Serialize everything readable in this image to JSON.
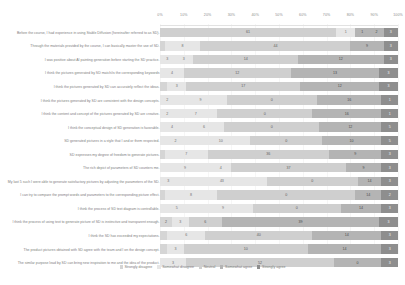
{
  "chart_data": {
    "type": "bar",
    "title": "",
    "subtitle": "",
    "xlabel": "",
    "ylabel": "",
    "orientation": "horizontal",
    "stacked": true,
    "normalized_percent": true,
    "grid": true,
    "legend_position": "bottom",
    "xlim": [
      0,
      100
    ],
    "xticks": [
      "0%",
      "10%",
      "20%",
      "30%",
      "40%",
      "50%",
      "60%",
      "70%",
      "80%",
      "90%",
      "100%"
    ],
    "legend": [
      "Strongly disagree",
      "Somewhat disagree",
      "Neutral",
      "Somewhat agree",
      "Strongly agree"
    ],
    "series": [
      {
        "name": "Strongly disagree",
        "color": "#d5d5d5"
      },
      {
        "name": "Somewhat disagree",
        "color": "#e6e6e6"
      },
      {
        "name": "Neutral",
        "color": "#cfcfcf"
      },
      {
        "name": "Somewhat agree",
        "color": "#b4b4b4"
      },
      {
        "name": "Strongly agree",
        "color": "#8e8e8e"
      }
    ],
    "categories": [
      "Before the course, I had experience in using Stable Diffusion (hereinafter referred to as SD).",
      "Through the materials provided by the course, I can basically master the use of SD.",
      "I was positive about AI painting generation before starting the SD practice.",
      "I think the pictures generated by SD match/is the corresponding keywords",
      "I think the pictures generated by SD can accurately reflect the ideas.",
      "I think the pictures generated by SD are consistent with the design concepts.",
      "I think the content and concept of the pictures generated by SD are creative.",
      "I think the conceptual design of SD generation is favorable.",
      "SD generated pictures in a style that I and or them respected.",
      "SD expresses my degree of freedom to generate pictures.",
      "The rich depict of parameters of SD counters me.",
      "My last 5 such I were able to generate satisfactory pictures by adjusting the parameters of the SD.",
      "I can try to compare the prompt words and parameters to the corresponding picture effect.",
      "I think the process of SD text diagram is controllable.",
      "I think the process of using text to generate picture of SD is instinctive and transparent enough.",
      "I think the SD has exceeded my expectations.",
      "The product pictures obtained with SD agree with the team and I on the design concept.",
      "The similar purpose lead by SD can bring new inspiration to me and the idea of the product."
    ],
    "rows": [
      {
        "label": "Before the course, I had experience in using Stable Diffusion (hereinafter referred to as SD).",
        "values": [
          0,
          0,
          61,
          1,
          1,
          2,
          3
        ],
        "segments": [
          {
            "series": 2,
            "value": 61,
            "pct": 74.0
          },
          {
            "series": 1,
            "value": 1,
            "pct": 8.0
          },
          {
            "series": 3,
            "value": 1,
            "pct": 6.0
          },
          {
            "series": 3,
            "value": 2,
            "pct": 6.0
          },
          {
            "series": 4,
            "value": 3,
            "pct": 6.0
          }
        ]
      },
      {
        "label": "Through the materials provided by the course, I can basically master the use of SD.",
        "segments": [
          {
            "series": 0,
            "value": 1,
            "pct": 2.0
          },
          {
            "series": 1,
            "value": 8,
            "pct": 15.0
          },
          {
            "series": 2,
            "value": 44,
            "pct": 63.0
          },
          {
            "series": 3,
            "value": 9,
            "pct": 14.0
          },
          {
            "series": 4,
            "value": 3,
            "pct": 6.0
          }
        ]
      },
      {
        "label": "I was positive about AI painting generation before starting the SD practice.",
        "segments": [
          {
            "series": 1,
            "value": 3,
            "pct": 6.0
          },
          {
            "series": 1,
            "value": 3,
            "pct": 8.0
          },
          {
            "series": 2,
            "value": 14,
            "pct": 44.0
          },
          {
            "series": 3,
            "value": 12,
            "pct": 36.0
          },
          {
            "series": 4,
            "value": 3,
            "pct": 6.0
          }
        ]
      },
      {
        "label": "I think the pictures generated by SD match/is the corresponding keywords",
        "segments": [
          {
            "series": 1,
            "value": 4,
            "pct": 10.0
          },
          {
            "series": 2,
            "value": 12,
            "pct": 45.0
          },
          {
            "series": 3,
            "value": 13,
            "pct": 37.0
          },
          {
            "series": 4,
            "value": 3,
            "pct": 8.0
          }
        ]
      },
      {
        "label": "I think the pictures generated by SD can accurately reflect the ideas.",
        "segments": [
          {
            "series": 0,
            "value": 1,
            "pct": 3.0
          },
          {
            "series": 1,
            "value": 3,
            "pct": 8.0
          },
          {
            "series": 2,
            "value": 17,
            "pct": 48.0
          },
          {
            "series": 3,
            "value": 12,
            "pct": 33.0
          },
          {
            "series": 4,
            "value": 3,
            "pct": 8.0
          }
        ]
      },
      {
        "label": "I think the pictures generated by SD are consistent with the design concepts.",
        "segments": [
          {
            "series": 1,
            "value": 2,
            "pct": 6.0
          },
          {
            "series": 1,
            "value": 9,
            "pct": 22.0
          },
          {
            "series": 2,
            "value": 0,
            "pct": 38.0
          },
          {
            "series": 3,
            "value": 16,
            "pct": 27.0
          },
          {
            "series": 4,
            "value": 1,
            "pct": 7.0
          }
        ]
      },
      {
        "label": "I think the content and concept of the pictures generated by SD are creative.",
        "segments": [
          {
            "series": 1,
            "value": 2,
            "pct": 6.0
          },
          {
            "series": 1,
            "value": 7,
            "pct": 18.0
          },
          {
            "series": 2,
            "value": 0,
            "pct": 40.0
          },
          {
            "series": 3,
            "value": 16,
            "pct": 29.0
          },
          {
            "series": 4,
            "value": 1,
            "pct": 7.0
          }
        ]
      },
      {
        "label": "I think the conceptual design of SD generation is favorable.",
        "segments": [
          {
            "series": 1,
            "value": 4,
            "pct": 10.0
          },
          {
            "series": 1,
            "value": 6,
            "pct": 17.0
          },
          {
            "series": 2,
            "value": 0,
            "pct": 40.0
          },
          {
            "series": 3,
            "value": 12,
            "pct": 26.0
          },
          {
            "series": 4,
            "value": 5,
            "pct": 7.0
          }
        ]
      },
      {
        "label": "SD generated pictures in a style that I and or them respected.",
        "segments": [
          {
            "series": 1,
            "value": 2,
            "pct": 13.0
          },
          {
            "series": 1,
            "value": 10,
            "pct": 25.0
          },
          {
            "series": 2,
            "value": 0,
            "pct": 30.0
          },
          {
            "series": 3,
            "value": 10,
            "pct": 25.0
          },
          {
            "series": 4,
            "value": 5,
            "pct": 7.0
          }
        ]
      },
      {
        "label": "SD expresses my degree of freedom to generate pictures.",
        "segments": [
          {
            "series": 0,
            "value": 1,
            "pct": 2.0
          },
          {
            "series": 1,
            "value": 7,
            "pct": 18.0
          },
          {
            "series": 2,
            "value": 36,
            "pct": 51.0
          },
          {
            "series": 3,
            "value": 9,
            "pct": 22.0
          },
          {
            "series": 4,
            "value": 3,
            "pct": 7.0
          }
        ]
      },
      {
        "label": "The rich depict of parameters of SD counters me.",
        "segments": [
          {
            "series": 1,
            "value": 9,
            "pct": 21.0
          },
          {
            "series": 1,
            "value": 4,
            "pct": 9.0
          },
          {
            "series": 2,
            "value": 37,
            "pct": 48.0
          },
          {
            "series": 3,
            "value": 9,
            "pct": 15.0
          },
          {
            "series": 4,
            "value": 3,
            "pct": 7.0
          }
        ]
      },
      {
        "label": "My last 5 such I were able to generate satisfactory pictures by adjusting the parameters of the SD.",
        "segments": [
          {
            "series": 1,
            "value": 3,
            "pct": 7.0
          },
          {
            "series": 1,
            "value": 43,
            "pct": 38.0
          },
          {
            "series": 2,
            "value": 0,
            "pct": 38.0
          },
          {
            "series": 3,
            "value": 14,
            "pct": 10.0
          },
          {
            "series": 4,
            "value": 3,
            "pct": 7.0
          }
        ]
      },
      {
        "label": "I can try to compare the prompt words and parameters to the corresponding picture effect.",
        "segments": [
          {
            "series": 0,
            "value": 1,
            "pct": 2.0
          },
          {
            "series": 1,
            "value": 8,
            "pct": 22.0
          },
          {
            "series": 2,
            "value": 0,
            "pct": 58.0
          },
          {
            "series": 3,
            "value": 14,
            "pct": 11.0
          },
          {
            "series": 4,
            "value": 2,
            "pct": 7.0
          }
        ]
      },
      {
        "label": "I think the process of SD text diagram is controllable.",
        "segments": [
          {
            "series": 1,
            "value": 5,
            "pct": 14.0
          },
          {
            "series": 1,
            "value": 9,
            "pct": 25.0
          },
          {
            "series": 2,
            "value": 0,
            "pct": 37.0
          },
          {
            "series": 3,
            "value": 14,
            "pct": 17.0
          },
          {
            "series": 4,
            "value": 3,
            "pct": 7.0
          }
        ]
      },
      {
        "label": "I think the process of using text to generate picture of SD is instinctive and transparent enough.",
        "segments": [
          {
            "series": 0,
            "value": 2,
            "pct": 5.0
          },
          {
            "series": 1,
            "value": 3,
            "pct": 7.0
          },
          {
            "series": 2,
            "value": 6,
            "pct": 14.0
          },
          {
            "series": 3,
            "value": 39,
            "pct": 66.0
          },
          {
            "series": 4,
            "value": 3,
            "pct": 8.0
          }
        ]
      },
      {
        "label": "I think the SD has exceeded my expectations.",
        "segments": [
          {
            "series": 0,
            "value": 1,
            "pct": 3.0
          },
          {
            "series": 1,
            "value": 6,
            "pct": 16.0
          },
          {
            "series": 2,
            "value": 40,
            "pct": 45.0
          },
          {
            "series": 3,
            "value": 14,
            "pct": 29.0
          },
          {
            "series": 4,
            "value": 3,
            "pct": 7.0
          }
        ]
      },
      {
        "label": "The product pictures obtained with SD agree with the team and I on the design concept.",
        "segments": [
          {
            "series": 0,
            "value": 1,
            "pct": 3.0
          },
          {
            "series": 1,
            "value": 3,
            "pct": 7.0
          },
          {
            "series": 2,
            "value": 10,
            "pct": 52.0
          },
          {
            "series": 3,
            "value": 14,
            "pct": 31.0
          },
          {
            "series": 4,
            "value": 3,
            "pct": 7.0
          }
        ]
      },
      {
        "label": "The similar purpose lead by SD can bring new inspiration to me and the idea of the product.",
        "segments": [
          {
            "series": 1,
            "value": 3,
            "pct": 11.0
          },
          {
            "series": 2,
            "value": 52,
            "pct": 62.0
          },
          {
            "series": 3,
            "value": 0,
            "pct": 20.0
          },
          {
            "series": 4,
            "value": 3,
            "pct": 7.0
          }
        ]
      }
    ]
  }
}
